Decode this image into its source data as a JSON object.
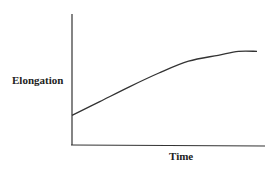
{
  "chart_data": {
    "type": "line",
    "title": "",
    "xlabel": "Time",
    "ylabel": "Elongation",
    "grid": false,
    "legend": null,
    "x_ticks": [],
    "y_ticks": [],
    "series": [
      {
        "name": "Elongation",
        "x": [
          0,
          0.15,
          0.31,
          0.47,
          0.63,
          0.79,
          0.9,
          1.0
        ],
        "values": [
          0.3,
          0.44,
          0.59,
          0.73,
          0.85,
          0.91,
          0.95,
          0.95
        ]
      }
    ],
    "xlim": [
      0,
      1.05
    ],
    "ylim": [
      0,
      1.0
    ]
  },
  "labels": {
    "x_axis": "Time",
    "y_axis": "Elongation"
  },
  "colors": {
    "line": "#333333",
    "axis": "#333333"
  }
}
